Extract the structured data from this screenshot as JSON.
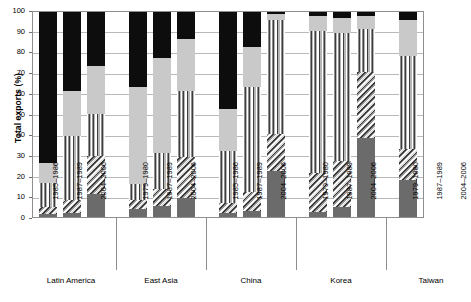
{
  "chart_data": {
    "type": "bar",
    "subtype": "stacked-bar-grouped",
    "title": "",
    "xlabel": "",
    "ylabel": "Total exports (%)",
    "ylim": [
      0,
      100
    ],
    "ytick_labels": [
      "0",
      "10",
      "20",
      "30",
      "40",
      "50",
      "60",
      "70",
      "80",
      "90",
      "100"
    ],
    "ytick_values": [
      0,
      10,
      20,
      30,
      40,
      50,
      60,
      70,
      80,
      90,
      100
    ],
    "grid": true,
    "legend_position": "none",
    "series": [
      {
        "name": "segment-1",
        "pattern": "solid-dark-gray",
        "color": "#6b6b6b"
      },
      {
        "name": "segment-2",
        "pattern": "diagonal-hatch",
        "color": "#3a3a3a"
      },
      {
        "name": "segment-3",
        "pattern": "vertical-stripes",
        "color": "#3d3d3d"
      },
      {
        "name": "segment-4",
        "pattern": "solid-light-gray",
        "color": "#c9c9c9"
      },
      {
        "name": "segment-5",
        "pattern": "solid-black",
        "color": "#0d0d0d"
      }
    ],
    "groups": [
      {
        "label": "Latin America",
        "bars": [
          {
            "category": "1985–1986",
            "values": [
              1.5,
              3.5,
              11.5,
              9.5,
              74.0
            ]
          },
          {
            "category": "1987–1989",
            "values": [
              2.0,
              6.0,
              31.0,
              22.0,
              39.0
            ]
          },
          {
            "category": "2004–2006",
            "values": [
              11.0,
              18.5,
              20.5,
              23.0,
              27.0
            ]
          }
        ]
      },
      {
        "label": "East Asia",
        "bars": [
          {
            "category": "1979–1980",
            "values": [
              4.0,
              4.0,
              8.0,
              47.0,
              37.0
            ]
          },
          {
            "category": "1987–1989",
            "values": [
              5.5,
              8.0,
              17.5,
              46.0,
              23.0
            ]
          },
          {
            "category": "2004–2006",
            "values": [
              9.0,
              20.0,
              32.0,
              25.0,
              14.0
            ]
          }
        ]
      },
      {
        "label": "China",
        "bars": [
          {
            "category": "1985–1986",
            "values": [
              2.0,
              5.0,
              25.0,
              20.0,
              48.0
            ]
          },
          {
            "category": "1987–1989",
            "values": [
              3.0,
              9.0,
              51.0,
              19.0,
              18.0
            ]
          },
          {
            "category": "2004–2006",
            "values": [
              22.0,
              18.0,
              55.0,
              3.0,
              2.0
            ]
          }
        ]
      },
      {
        "label": "Korea",
        "bars": [
          {
            "category": "1979–1980",
            "values": [
              2.5,
              19.0,
              68.5,
              7.0,
              3.0
            ]
          },
          {
            "category": "1987–1989",
            "values": [
              5.0,
              22.0,
              62.0,
              7.0,
              4.0
            ]
          },
          {
            "category": "2004–2006",
            "values": [
              38.0,
              32.0,
              21.0,
              6.0,
              3.0
            ]
          }
        ]
      },
      {
        "label": "Taiwan",
        "bars": [
          {
            "category": "1979–1980",
            "values": [
              18.0,
              15.0,
              45.0,
              17.0,
              5.0
            ]
          },
          {
            "category": "1987–1989",
            "values": [
              24.0,
              19.0,
              44.0,
              8.0,
              5.0
            ]
          },
          {
            "category": "2004–2006",
            "values": [
              44.0,
              26.0,
              22.0,
              5.0,
              3.0
            ]
          }
        ]
      }
    ]
  }
}
